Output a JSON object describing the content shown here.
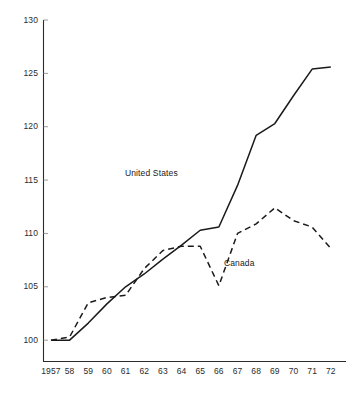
{
  "chart_data": {
    "type": "line",
    "title": "",
    "subtitle": "",
    "xlabel": "",
    "ylabel": "",
    "x": [
      1957,
      1958,
      1959,
      1960,
      1961,
      1962,
      1963,
      1964,
      1965,
      1966,
      1967,
      1968,
      1969,
      1970,
      1971,
      1972
    ],
    "x_tick_labels": [
      "1957",
      "58",
      "59",
      "60",
      "61",
      "62",
      "63",
      "64",
      "65",
      "66",
      "67",
      "68",
      "69",
      "70",
      "71",
      "72"
    ],
    "y_tick_labels": [
      "100",
      "105",
      "110",
      "115",
      "120",
      "125",
      "130"
    ],
    "y_ticks": [
      100,
      105,
      110,
      115,
      120,
      125,
      130
    ],
    "ylim": [
      98.0,
      130.0
    ],
    "xlim": [
      1956.6,
      1972.6
    ],
    "grid": false,
    "legend_position": "inline-annotation",
    "series": [
      {
        "name": "United States",
        "style": "solid",
        "color": "#1a1a1a",
        "label_x": 1963.0,
        "label_y": 115.7,
        "values": [
          100.0,
          100.0,
          101.6,
          103.4,
          105.0,
          106.2,
          107.6,
          108.9,
          110.3,
          110.6,
          114.5,
          119.2,
          120.3,
          122.9,
          125.4,
          125.6
        ]
      },
      {
        "name": "Canada",
        "style": "dashed",
        "color": "#1a1a1a",
        "label_x": 1966.7,
        "label_y": 107.2,
        "values": [
          100.0,
          100.3,
          103.5,
          104.0,
          104.2,
          106.7,
          108.4,
          108.8,
          108.8,
          105.1,
          110.0,
          110.9,
          112.4,
          111.2,
          110.6,
          108.6
        ]
      }
    ]
  },
  "axes": {
    "y_axis_name": "value-axis",
    "x_axis_name": "year-axis"
  }
}
